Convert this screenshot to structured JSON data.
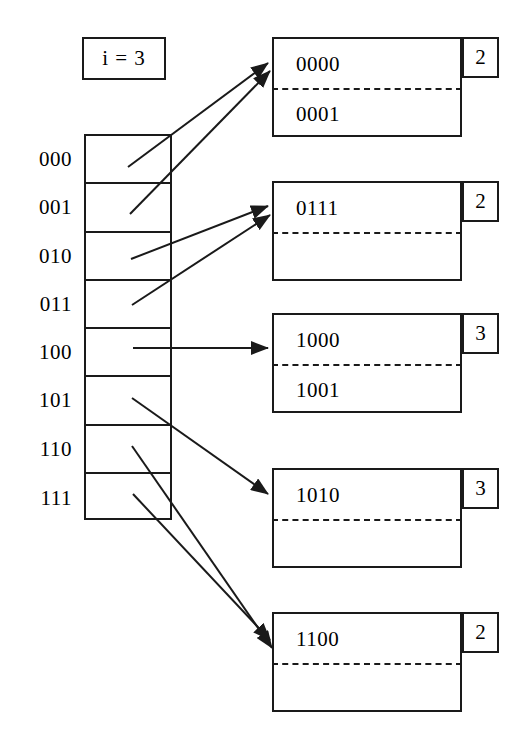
{
  "diagram": {
    "global_depth": {
      "label": "i = 3",
      "value": 3
    },
    "directory": {
      "name": "directory",
      "entries": [
        {
          "label": "000",
          "target_bucket": 0
        },
        {
          "label": "001",
          "target_bucket": 0
        },
        {
          "label": "010",
          "target_bucket": 1
        },
        {
          "label": "011",
          "target_bucket": 1
        },
        {
          "label": "100",
          "target_bucket": 2
        },
        {
          "label": "101",
          "target_bucket": 3
        },
        {
          "label": "110",
          "target_bucket": 4
        },
        {
          "label": "111",
          "target_bucket": 4
        }
      ]
    },
    "buckets": [
      {
        "slots": [
          "0000",
          "0001"
        ],
        "local_depth": "2"
      },
      {
        "slots": [
          "0111",
          ""
        ],
        "local_depth": "2"
      },
      {
        "slots": [
          "1000",
          "1001"
        ],
        "local_depth": "3"
      },
      {
        "slots": [
          "1010",
          ""
        ],
        "local_depth": "3"
      },
      {
        "slots": [
          "1100",
          ""
        ],
        "local_depth": "2"
      }
    ],
    "style": {
      "ink": "#1a1a1a",
      "background": "#ffffff"
    }
  }
}
